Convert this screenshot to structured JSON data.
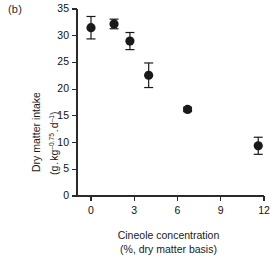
{
  "panel": {
    "label": "(b)"
  },
  "chart_data": {
    "type": "scatter",
    "title": "",
    "xlabel": "Cineole concentration",
    "xlabel_sub": "(%, dry matter basis)",
    "ylabel": "Dry matter intake",
    "ylabel_sub": "(g . kg-0.75 . d-1)",
    "ylabel_sub_parts": {
      "open": "(g",
      "sep1": ".",
      "kg": "kg",
      "kg_exp": "–0.75",
      "sep2": ".",
      "d": "d",
      "d_exp": "–1",
      "close": ")"
    },
    "xlim": [
      0,
      12
    ],
    "ylim": [
      0,
      35
    ],
    "xticks": [
      0,
      3,
      6,
      9,
      12
    ],
    "yticks": [
      0,
      5,
      10,
      15,
      20,
      25,
      30,
      35
    ],
    "xtick_labels": [
      "0",
      "3",
      "6",
      "9",
      "12"
    ],
    "ytick_labels": [
      "0",
      "5",
      "10",
      "15",
      "20",
      "25",
      "30",
      "35"
    ],
    "grid": false,
    "legend": "none",
    "marker": "filled-circle",
    "marker_color": "#1a1a1a",
    "errorbar_color": "#1a1a1a",
    "x": [
      0.0,
      1.6,
      2.7,
      4.0,
      6.7,
      11.6
    ],
    "y": [
      31.5,
      32.2,
      29.0,
      22.6,
      16.2,
      9.4
    ],
    "yerr": [
      2.1,
      0.9,
      1.6,
      2.3,
      0.4,
      1.6
    ],
    "points": [
      {
        "x": 0.0,
        "y": 31.5,
        "yerr": 2.1
      },
      {
        "x": 1.6,
        "y": 32.2,
        "yerr": 0.9
      },
      {
        "x": 2.7,
        "y": 29.0,
        "yerr": 1.6
      },
      {
        "x": 4.0,
        "y": 22.6,
        "yerr": 2.3
      },
      {
        "x": 6.7,
        "y": 16.2,
        "yerr": 0.4
      },
      {
        "x": 11.6,
        "y": 9.4,
        "yerr": 1.6
      }
    ]
  }
}
